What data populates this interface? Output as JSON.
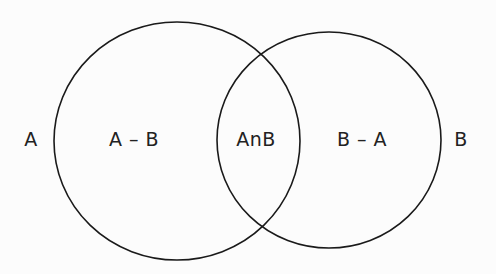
{
  "diagram": {
    "type": "venn",
    "stroke_color": "#1a1a1a",
    "sets": [
      {
        "name": "A",
        "cx": 177,
        "cy": 141,
        "rx": 123,
        "ry": 119
      },
      {
        "name": "B",
        "cx": 329,
        "cy": 140,
        "rx": 112,
        "ry": 108
      }
    ],
    "labels": {
      "outside_a": {
        "text": "A",
        "x": 31,
        "y": 139
      },
      "a_minus_b": {
        "text": "A – B",
        "x": 134,
        "y": 139
      },
      "a_intersect_b": {
        "text": "AnB",
        "x": 256,
        "y": 139
      },
      "b_minus_a": {
        "text": "B – A",
        "x": 362,
        "y": 139
      },
      "outside_b": {
        "text": "B",
        "x": 461,
        "y": 139
      }
    }
  }
}
